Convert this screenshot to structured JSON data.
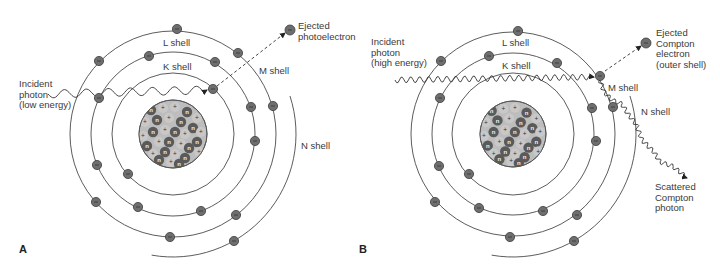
{
  "figure": {
    "panels": [
      {
        "id": "A",
        "letter": "A",
        "letter_pos": [
          19,
          253
        ],
        "center": [
          173,
          134
        ],
        "nucleus_radius": 34,
        "shells": [
          {
            "name": "K",
            "label": "K shell",
            "r": 61,
            "label_pos": [
              163,
              70
            ]
          },
          {
            "name": "L",
            "label": "L shell",
            "r": 82,
            "label_pos": [
              163,
              46
            ]
          },
          {
            "name": "M",
            "label": "M shell",
            "r": 103,
            "label_pos": [
              259,
              74
            ]
          },
          {
            "name": "N",
            "label": "N shell",
            "r": 123,
            "label_pos": [
              301,
              149
            ],
            "partial": true,
            "start_deg": -18,
            "end_deg": 100
          }
        ],
        "electrons": [
          [
            213,
            89
          ],
          [
            128,
            174
          ],
          [
            149,
            56
          ],
          [
            215,
            62
          ],
          [
            99,
            98
          ],
          [
            251,
            107
          ],
          [
            255,
            141
          ],
          [
            97,
            165
          ],
          [
            138,
            207
          ],
          [
            201,
            211
          ],
          [
            177,
            29
          ],
          [
            99,
            61
          ],
          [
            238,
            53
          ],
          [
            273,
            106
          ],
          [
            96,
            202
          ],
          [
            170,
            237
          ],
          [
            236,
            215
          ],
          [
            234,
            241
          ]
        ],
        "ejected": {
          "pos": [
            290,
            30
          ],
          "from": [
            217,
            86
          ],
          "label": [
            "Ejected",
            "photoelectron"
          ],
          "label_pos": [
            298,
            29
          ]
        },
        "incident": {
          "label": [
            "Incident",
            "photon",
            "(low energy)"
          ],
          "label_pos": [
            19,
            87
          ],
          "start": [
            48,
            94
          ],
          "end": [
            207,
            90
          ],
          "wavelength": 22,
          "amplitude": 4
        }
      },
      {
        "id": "B",
        "letter": "B",
        "letter_pos": [
          359,
          253
        ],
        "center": [
          513,
          134
        ],
        "nucleus_radius": 33,
        "shells": [
          {
            "name": "K",
            "label": "K shell",
            "r": 61,
            "label_pos": [
              502,
              69
            ]
          },
          {
            "name": "L",
            "label": "L shell",
            "r": 81,
            "label_pos": [
              502,
              46
            ]
          },
          {
            "name": "M",
            "label": "M shell",
            "r": 102,
            "label_pos": [
              608,
              91
            ]
          },
          {
            "name": "N",
            "label": "N shell",
            "r": 123,
            "label_pos": [
              641,
              115
            ],
            "partial": true,
            "start_deg": -18,
            "end_deg": 100
          }
        ],
        "electrons": [
          [
            469,
            174
          ],
          [
            489,
            56
          ],
          [
            557,
            63
          ],
          [
            440,
            98
          ],
          [
            592,
            108
          ],
          [
            596,
            141
          ],
          [
            439,
            166
          ],
          [
            479,
            208
          ],
          [
            543,
            211
          ],
          [
            518,
            31
          ],
          [
            441,
            61
          ],
          [
            600,
            76
          ],
          [
            613,
            107
          ],
          [
            435,
            202
          ],
          [
            510,
            237
          ],
          [
            577,
            215
          ],
          [
            574,
            241
          ]
        ],
        "ejected": {
          "pos": [
            646,
            43
          ],
          "from": [
            605,
            71
          ],
          "label": [
            "Ejected",
            "Compton",
            "electron",
            "(outer shell)"
          ],
          "label_pos": [
            656,
            36
          ]
        },
        "incident": {
          "label": [
            "Incident",
            "photon",
            "(high energy)"
          ],
          "label_pos": [
            371,
            45
          ],
          "start": [
            395,
            80
          ],
          "end": [
            594,
            77
          ],
          "wavelength": 9,
          "amplitude": 3
        },
        "scattered": {
          "label": [
            "Scattered",
            "Compton",
            "photon"
          ],
          "label_pos": [
            655,
            190
          ],
          "points": [
            [
              600,
              80
            ],
            [
              604,
              92
            ],
            [
              612,
              100
            ],
            [
              622,
              104
            ],
            [
              628,
              114
            ],
            [
              636,
              124
            ],
            [
              642,
              140
            ],
            [
              654,
              152
            ],
            [
              660,
              162
            ],
            [
              672,
              166
            ],
            [
              680,
              172
            ],
            [
              687,
              178
            ]
          ],
          "amplitude": 2.2,
          "wavelength": 7
        }
      }
    ],
    "nucleus_particles": [
      [
        "n",
        -22,
        -24
      ],
      [
        "p",
        -10,
        -26
      ],
      [
        "p",
        2,
        -27
      ],
      [
        "n",
        14,
        -22
      ],
      [
        "p",
        24,
        -16
      ],
      [
        "p",
        -28,
        -12
      ],
      [
        "n",
        -16,
        -14
      ],
      [
        "p",
        -4,
        -16
      ],
      [
        "n",
        8,
        -12
      ],
      [
        "n",
        20,
        -6
      ],
      [
        "p",
        28,
        -2
      ],
      [
        "p",
        -30,
        2
      ],
      [
        "n",
        -20,
        -2
      ],
      [
        "p",
        -8,
        -4
      ],
      [
        "n",
        2,
        -2
      ],
      [
        "p",
        12,
        0
      ],
      [
        "n",
        24,
        8
      ],
      [
        "n",
        -26,
        12
      ],
      [
        "p",
        -14,
        8
      ],
      [
        "n",
        -4,
        8
      ],
      [
        "p",
        8,
        10
      ],
      [
        "n",
        16,
        14
      ],
      [
        "p",
        26,
        18
      ],
      [
        "p",
        -20,
        20
      ],
      [
        "n",
        -8,
        18
      ],
      [
        "p",
        2,
        20
      ],
      [
        "n",
        12,
        24
      ],
      [
        "n",
        -14,
        26
      ],
      [
        "p",
        -2,
        28
      ],
      [
        "n",
        6,
        30
      ]
    ],
    "colors": {
      "line": "#333333",
      "electron_fill": "#6e6e6e",
      "neutron_fill": "#5a5a5a",
      "proton_fill": "#c8c8c8",
      "nucleus_bg": "#bdbdbd"
    }
  }
}
